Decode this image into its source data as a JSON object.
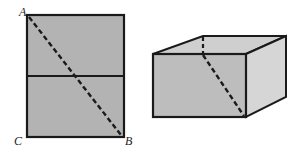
{
  "figure": {
    "left_shape": {
      "type": "rectangle-net",
      "fill": "#b3b3b3",
      "stroke": "#1a1a1a",
      "labels": {
        "A": "A",
        "B": "B",
        "C": "C"
      },
      "rect": {
        "x": 27,
        "y": 15,
        "width": 97,
        "height": 122
      },
      "fold_line_y": 76,
      "dashed_diagonal": {
        "from": "A",
        "to": "B"
      }
    },
    "right_shape": {
      "type": "rectangular-box",
      "front_fill": "#bdbdbd",
      "side_fill": "#d6d6d6",
      "top_fill": "#cfcfcf",
      "stroke": "#1a1a1a",
      "dashed_path": "wraps from back-top edge across front face to bottom-right corner"
    }
  }
}
